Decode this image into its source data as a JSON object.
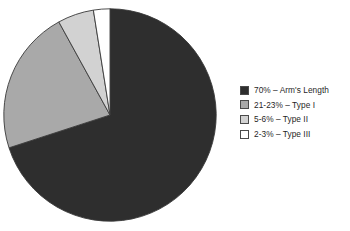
{
  "chart_data": {
    "type": "pie",
    "title": "",
    "xlabel": "",
    "ylabel": "",
    "legend_position": "right",
    "grid": false,
    "start_angle_deg": 0,
    "direction": "clockwise",
    "categories": [
      "Arm's Length",
      "Type I",
      "Type II",
      "Type III"
    ],
    "values": [
      70,
      22,
      5.5,
      2.5
    ],
    "value_labels": [
      "70%",
      "21-23%",
      "5-6%",
      "2-3%"
    ],
    "colors": [
      "#2e2e2e",
      "#a9a9a9",
      "#d2d2d2",
      "#ffffff"
    ],
    "slice_border_color": "#3a3a3a",
    "legend_entries": [
      "70% – Arm's Length",
      "21-23% – Type I",
      "5-6% – Type II",
      "2-3% – Type III"
    ]
  },
  "figure": {
    "background": "#ffffff",
    "title_fragment": ""
  },
  "legend": {
    "items": [
      {
        "label": "70% – Arm's Length",
        "color": "#2e2e2e",
        "swatch_name": "arms-length"
      },
      {
        "label": "21-23% – Type I",
        "color": "#a9a9a9",
        "swatch_name": "type-i"
      },
      {
        "label": "5-6% – Type II",
        "color": "#d2d2d2",
        "swatch_name": "type-ii"
      },
      {
        "label": "2-3% – Type III",
        "color": "#ffffff",
        "swatch_name": "type-iii"
      }
    ]
  }
}
